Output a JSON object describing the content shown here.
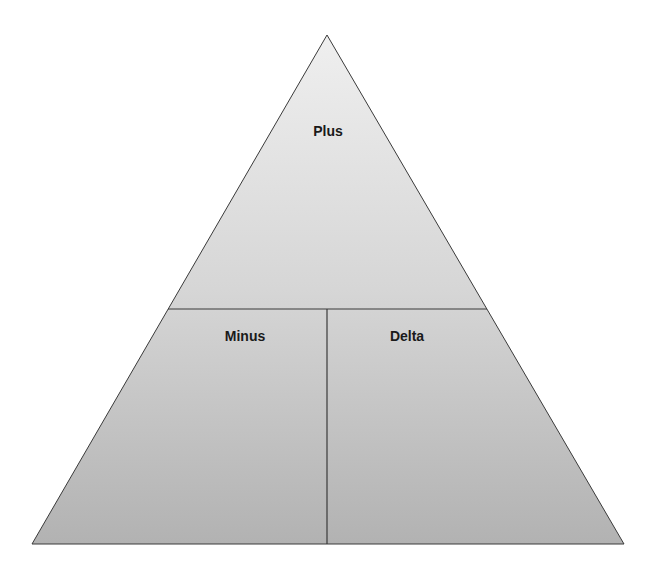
{
  "diagram": {
    "type": "pyramid",
    "colors": {
      "fill_top": "#efefef",
      "fill_bottom": "#b2b2b2",
      "stroke": "#3a3a3a",
      "text": "#1a1a1a",
      "background": "#ffffff"
    },
    "sections": [
      {
        "id": "top",
        "label": "Plus"
      },
      {
        "id": "bottom-left",
        "label": "Minus"
      },
      {
        "id": "bottom-right",
        "label": "Delta"
      }
    ]
  }
}
